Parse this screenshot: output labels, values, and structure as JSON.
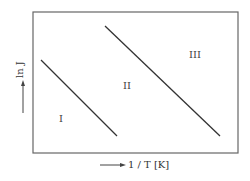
{
  "diagram": {
    "y_axis_label": "ln J",
    "x_axis_label": "1 / T [K]",
    "regions": [
      {
        "label": "I"
      },
      {
        "label": "II"
      },
      {
        "label": "III"
      }
    ]
  }
}
